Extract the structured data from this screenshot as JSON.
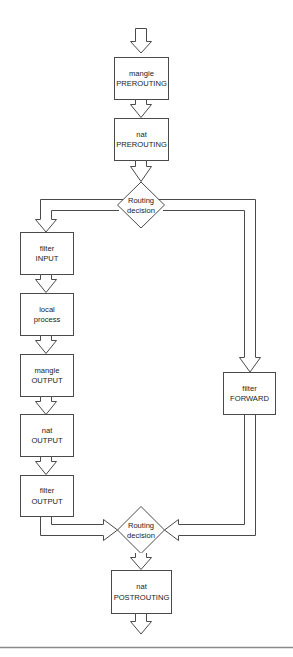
{
  "diagram": {
    "title": "",
    "colors": {
      "stroke": "#4a4a4a",
      "fill": "#ffffff",
      "text": "#222222",
      "rule": "#8a8a8a"
    },
    "nodes": {
      "mangle_prerouting": {
        "line1": "mangle",
        "line2": "PREROUTING",
        "shape": "box"
      },
      "nat_prerouting": {
        "line1": "nat",
        "line2": "PREROUTING",
        "shape": "box"
      },
      "routing_decision_1": {
        "line1": "Routing",
        "line2": "decision",
        "shape": "diamond"
      },
      "filter_input": {
        "line1": "filter",
        "line2": "INPUT",
        "shape": "box"
      },
      "local_process": {
        "line1": "local",
        "line2": "process",
        "shape": "box"
      },
      "mangle_output": {
        "line1": "mangle",
        "line2": "OUTPUT",
        "shape": "box"
      },
      "nat_output": {
        "line1": "nat",
        "line2": "OUTPUT",
        "shape": "box"
      },
      "filter_output": {
        "line1": "filter",
        "line2": "OUTPUT",
        "shape": "box"
      },
      "filter_forward": {
        "line1": "filter",
        "line2": "FORWARD",
        "shape": "box"
      },
      "routing_decision_2": {
        "line1": "Routing",
        "line2": "decision",
        "shape": "diamond"
      },
      "nat_postrouting": {
        "line1": "nat",
        "line2": "POSTROUTING",
        "shape": "box"
      }
    },
    "edges": [
      {
        "from": "entry",
        "to": "mangle_prerouting"
      },
      {
        "from": "mangle_prerouting",
        "to": "nat_prerouting"
      },
      {
        "from": "nat_prerouting",
        "to": "routing_decision_1"
      },
      {
        "from": "routing_decision_1",
        "to": "filter_input"
      },
      {
        "from": "routing_decision_1",
        "to": "filter_forward"
      },
      {
        "from": "filter_input",
        "to": "local_process"
      },
      {
        "from": "local_process",
        "to": "mangle_output"
      },
      {
        "from": "mangle_output",
        "to": "nat_output"
      },
      {
        "from": "nat_output",
        "to": "filter_output"
      },
      {
        "from": "filter_output",
        "to": "routing_decision_2"
      },
      {
        "from": "filter_forward",
        "to": "routing_decision_2"
      },
      {
        "from": "routing_decision_2",
        "to": "nat_postrouting"
      },
      {
        "from": "nat_postrouting",
        "to": "exit"
      }
    ]
  }
}
